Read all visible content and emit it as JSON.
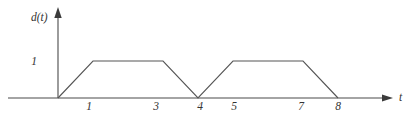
{
  "chart_data": {
    "type": "line",
    "title": "",
    "subtitle": "",
    "xlabel": "t",
    "ylabel": "d(t)",
    "xlim": [
      0,
      8.8
    ],
    "ylim": [
      0,
      1.45
    ],
    "grid": false,
    "legend": null,
    "series": [
      {
        "name": "d(t)",
        "x": [
          0,
          1,
          3,
          4,
          5,
          7,
          8
        ],
        "values": [
          0,
          1,
          1,
          0,
          1,
          1,
          0
        ]
      }
    ],
    "x_tick_labels": [
      "1",
      "3",
      "4",
      "5",
      "7",
      "8"
    ],
    "x_tick_values": [
      1,
      3,
      4,
      5,
      7,
      8
    ],
    "y_tick_labels": [
      "1"
    ],
    "y_tick_values": [
      1
    ],
    "annotations": [],
    "line_color": "#555555",
    "axis_color": "#4a4a4a",
    "background_color": "#ffffff"
  },
  "axes": {
    "y_axis_label": "d(t)",
    "x_axis_label": "t",
    "y_value_1": "1"
  },
  "x_ticks": [
    {
      "label": "1"
    },
    {
      "label": "3"
    },
    {
      "label": "4"
    },
    {
      "label": "5"
    },
    {
      "label": "7"
    },
    {
      "label": "8"
    }
  ]
}
